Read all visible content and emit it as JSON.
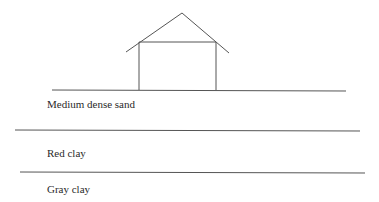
{
  "diagram": {
    "type": "soil-profile",
    "stroke_color": "#555555",
    "text_color": "#2a2a2a",
    "house": {
      "roof_peak": [
        182,
        13
      ],
      "roof_left_eave": [
        126,
        52
      ],
      "roof_right_eave": [
        229,
        53
      ],
      "wall_top_left": [
        139,
        42
      ],
      "wall_top_right": [
        216,
        42
      ],
      "wall_bottom_y": 90
    },
    "layers": [
      {
        "label": "Medium dense sand",
        "label_x": 47,
        "label_y": 98
      },
      {
        "label": "Red clay",
        "label_x": 47,
        "label_y": 147
      },
      {
        "label": "Gray clay",
        "label_x": 47,
        "label_y": 183
      }
    ],
    "boundaries": [
      {
        "name": "ground-surface",
        "x1": 52,
        "y1": 90,
        "x2": 346,
        "y2": 91
      },
      {
        "name": "sand-redclay-boundary",
        "x1": 15,
        "y1": 130,
        "x2": 360,
        "y2": 131
      },
      {
        "name": "redclay-grayclay-boundary",
        "x1": 20,
        "y1": 172,
        "x2": 365,
        "y2": 173
      }
    ]
  }
}
